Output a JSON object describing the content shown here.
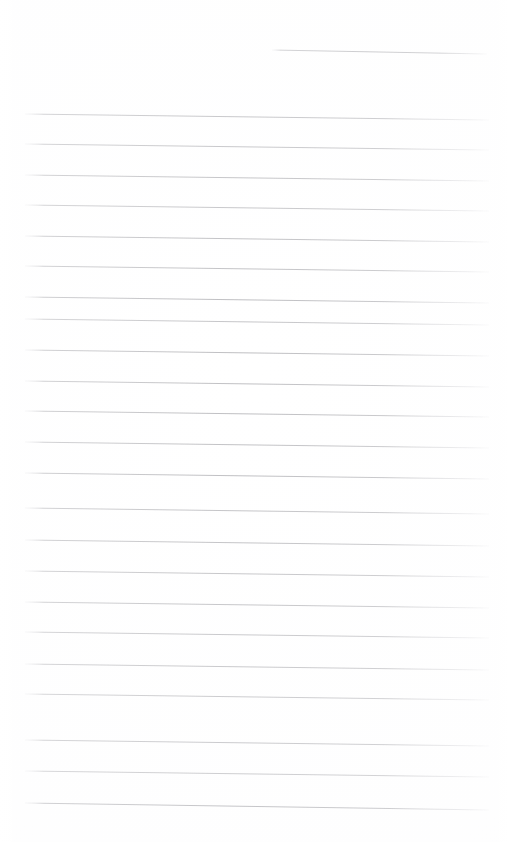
{
  "document": {
    "kind": "scanned-blank-lined-paper",
    "page_width": 508,
    "page_height": 842,
    "paper_color": "#ffffff",
    "rule_color": "#9a9a9f",
    "rule_color_light": "#c9c9ce",
    "written_text": "",
    "visible_text_content": "none",
    "orientation": "portrait"
  },
  "ruling": {
    "line_count_total": 24,
    "full_width_line_count": 23,
    "partial_line_count": 1,
    "left_margin_x": 25,
    "right_margin_x": 488,
    "average_line_spacing": 30.5,
    "tilt_px_over_page_width": 6,
    "lines": [
      {
        "name": "rule-partial-top",
        "x1": 272,
        "y1": 50,
        "x2": 487,
        "y2": 54,
        "width": 0.9,
        "opacity": 0.7,
        "partial": true
      },
      {
        "name": "rule-1",
        "x1": 25,
        "y1": 114,
        "x2": 489,
        "y2": 120,
        "width": 0.9,
        "opacity": 0.72,
        "partial": false
      },
      {
        "name": "rule-2",
        "x1": 25,
        "y1": 144,
        "x2": 489,
        "y2": 150,
        "width": 0.9,
        "opacity": 0.7,
        "partial": false
      },
      {
        "name": "rule-3",
        "x1": 25,
        "y1": 175,
        "x2": 489,
        "y2": 181,
        "width": 0.9,
        "opacity": 0.72,
        "partial": false
      },
      {
        "name": "rule-4",
        "x1": 25,
        "y1": 205,
        "x2": 489,
        "y2": 211,
        "width": 0.9,
        "opacity": 0.68,
        "partial": false
      },
      {
        "name": "rule-5",
        "x1": 25,
        "y1": 236,
        "x2": 489,
        "y2": 242,
        "width": 0.9,
        "opacity": 0.72,
        "partial": false
      },
      {
        "name": "rule-6",
        "x1": 25,
        "y1": 266,
        "x2": 489,
        "y2": 272,
        "width": 0.9,
        "opacity": 0.7,
        "partial": false
      },
      {
        "name": "rule-7",
        "x1": 25,
        "y1": 297,
        "x2": 489,
        "y2": 303,
        "width": 0.9,
        "opacity": 0.74,
        "partial": false
      },
      {
        "name": "rule-8",
        "x1": 25,
        "y1": 319,
        "x2": 489,
        "y2": 325,
        "width": 0.9,
        "opacity": 0.66,
        "partial": false
      },
      {
        "name": "rule-9",
        "x1": 25,
        "y1": 350,
        "x2": 489,
        "y2": 356,
        "width": 0.9,
        "opacity": 0.72,
        "partial": false
      },
      {
        "name": "rule-10",
        "x1": 25,
        "y1": 381,
        "x2": 489,
        "y2": 387,
        "width": 0.9,
        "opacity": 0.7,
        "partial": false
      },
      {
        "name": "rule-11",
        "x1": 25,
        "y1": 411,
        "x2": 489,
        "y2": 417,
        "width": 0.9,
        "opacity": 0.72,
        "partial": false
      },
      {
        "name": "rule-12",
        "x1": 25,
        "y1": 442,
        "x2": 489,
        "y2": 448,
        "width": 0.9,
        "opacity": 0.7,
        "partial": false
      },
      {
        "name": "rule-13",
        "x1": 25,
        "y1": 473,
        "x2": 489,
        "y2": 479,
        "width": 0.9,
        "opacity": 0.74,
        "partial": false
      },
      {
        "name": "rule-14",
        "x1": 25,
        "y1": 508,
        "x2": 489,
        "y2": 514,
        "width": 0.9,
        "opacity": 0.7,
        "partial": false
      },
      {
        "name": "rule-15",
        "x1": 25,
        "y1": 540,
        "x2": 489,
        "y2": 546,
        "width": 0.9,
        "opacity": 0.72,
        "partial": false
      },
      {
        "name": "rule-16",
        "x1": 25,
        "y1": 571,
        "x2": 489,
        "y2": 577,
        "width": 0.9,
        "opacity": 0.7,
        "partial": false
      },
      {
        "name": "rule-17",
        "x1": 25,
        "y1": 602,
        "x2": 489,
        "y2": 608,
        "width": 0.9,
        "opacity": 0.72,
        "partial": false
      },
      {
        "name": "rule-18",
        "x1": 25,
        "y1": 632,
        "x2": 489,
        "y2": 638,
        "width": 0.9,
        "opacity": 0.7,
        "partial": false
      },
      {
        "name": "rule-19",
        "x1": 25,
        "y1": 664,
        "x2": 489,
        "y2": 670,
        "width": 0.9,
        "opacity": 0.72,
        "partial": false
      },
      {
        "name": "rule-20",
        "x1": 25,
        "y1": 694,
        "x2": 489,
        "y2": 700,
        "width": 0.9,
        "opacity": 0.7,
        "partial": false
      },
      {
        "name": "rule-21",
        "x1": 25,
        "y1": 740,
        "x2": 489,
        "y2": 746,
        "width": 0.9,
        "opacity": 0.74,
        "partial": false
      },
      {
        "name": "rule-22",
        "x1": 25,
        "y1": 771,
        "x2": 489,
        "y2": 777,
        "width": 0.9,
        "opacity": 0.72,
        "partial": false
      },
      {
        "name": "rule-23",
        "x1": 25,
        "y1": 803,
        "x2": 489,
        "y2": 810,
        "width": 1.0,
        "opacity": 0.78,
        "partial": false
      }
    ]
  }
}
